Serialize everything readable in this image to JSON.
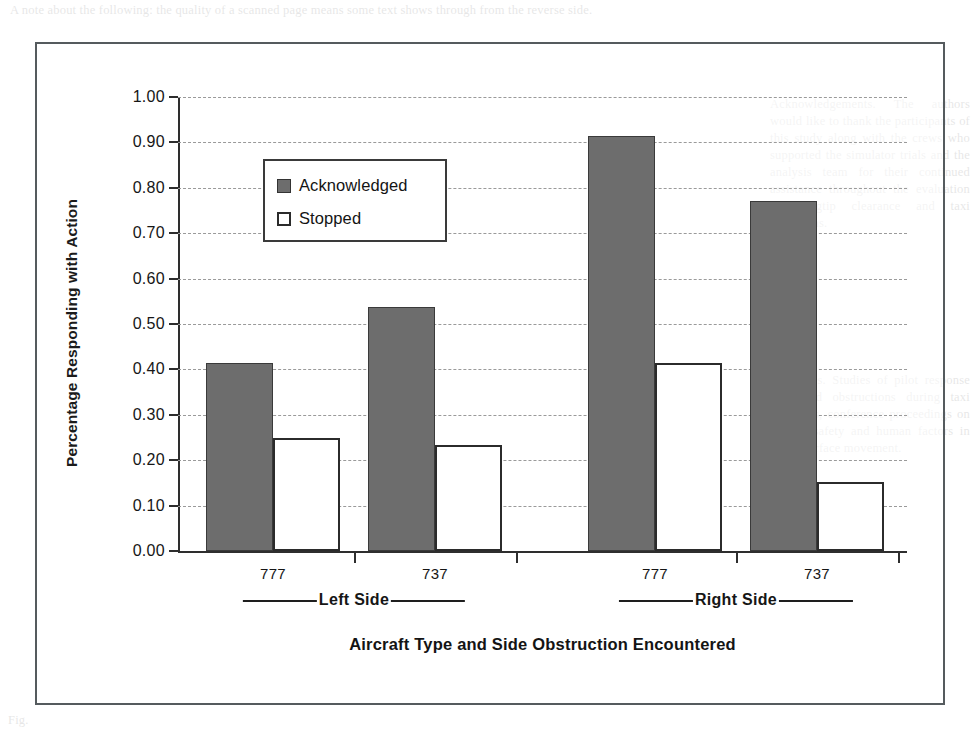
{
  "figure": {
    "legend_items": [
      {
        "label": "Acknowledged",
        "swatch": "filled-gray-square-icon",
        "color": "#6d6d6d"
      },
      {
        "label": "Stopped",
        "swatch": "empty-white-square-icon",
        "color": "#ffffff"
      }
    ]
  },
  "chart_data": {
    "type": "bar",
    "title": "",
    "xlabel": "Aircraft Type and Side Obstruction Encountered",
    "ylabel": "Percentage Responding with Action",
    "categories": [
      "777",
      "737",
      "777",
      "737"
    ],
    "group_labels": [
      "Left Side",
      "Right Side"
    ],
    "series": [
      {
        "name": "Acknowledged",
        "values": [
          0.415,
          0.537,
          0.915,
          0.77
        ],
        "color": "#6d6d6d"
      },
      {
        "name": "Stopped",
        "values": [
          0.25,
          0.233,
          0.415,
          0.152
        ],
        "color": "#ffffff"
      }
    ],
    "ylim": [
      0.0,
      1.0
    ],
    "ytick_labels": [
      "1.00",
      "0.90",
      "0.80",
      "0.70",
      "0.60",
      "0.50",
      "0.40",
      "0.30",
      "0.20",
      "0.10",
      "0.00"
    ],
    "ytick_values": [
      1.0,
      0.9,
      0.8,
      0.7,
      0.6,
      0.5,
      0.4,
      0.3,
      0.2,
      0.1,
      0.0
    ],
    "grid": true,
    "legend_position": "upper-left-inside"
  },
  "bleed_text": {
    "top": "A note about the following: the quality of a scanned page means some text shows through from the reverse side.",
    "right_top": "Acknowledgements. The authors would like to thank the participants of this study along with the crews who supported the simulator trials and the analysis team for their continued assistance throughout the evaluation of wingtip clearance and taxi operations.",
    "right_mid": "References. Studies of pilot response to ground obstructions during taxi operations, conference proceedings on aviation safety and human factors in airport surface movement.",
    "bottom": "Fig."
  }
}
